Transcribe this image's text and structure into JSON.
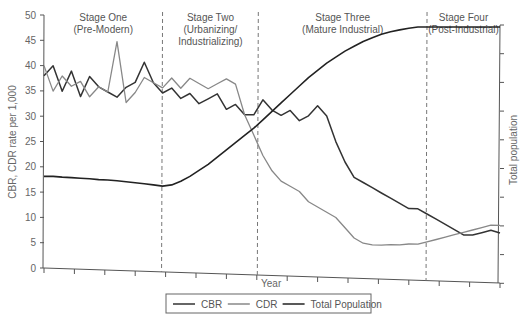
{
  "chart_data": {
    "type": "line",
    "title": "",
    "xlabel": "Year",
    "ylabel": "CBR, CDR rate per 1,000",
    "y2label": "Total population",
    "ylim": [
      0,
      50
    ],
    "yticks": [
      0,
      5,
      10,
      15,
      20,
      25,
      30,
      35,
      40,
      45,
      50
    ],
    "x_ticks_count": 16,
    "grid": false,
    "legend_position": "bottom",
    "stages": [
      {
        "name": "Stage One",
        "subtitle": [
          "(Pre-Modern)"
        ],
        "x_end": 0.26
      },
      {
        "name": "Stage Two",
        "subtitle": [
          "(Urbanizing/",
          "Industrializing)"
        ],
        "x_end": 0.47
      },
      {
        "name": "Stage Three",
        "subtitle": [
          "(Mature Industrial)"
        ],
        "x_end": 0.84
      },
      {
        "name": "Stage Four",
        "subtitle": [
          "(Post-Industrial)"
        ],
        "x_end": 1.0
      }
    ],
    "x": [
      0,
      0.02,
      0.04,
      0.06,
      0.08,
      0.1,
      0.12,
      0.14,
      0.16,
      0.18,
      0.2,
      0.22,
      0.24,
      0.26,
      0.28,
      0.3,
      0.32,
      0.34,
      0.36,
      0.38,
      0.4,
      0.42,
      0.44,
      0.46,
      0.48,
      0.5,
      0.52,
      0.54,
      0.56,
      0.58,
      0.6,
      0.62,
      0.64,
      0.66,
      0.68,
      0.7,
      0.72,
      0.74,
      0.76,
      0.78,
      0.8,
      0.82,
      0.84,
      0.86,
      0.88,
      0.9,
      0.92,
      0.94,
      0.96,
      0.98,
      1.0
    ],
    "series": [
      {
        "name": "CBR",
        "color": "#333333",
        "width": 1.5,
        "values": [
          38,
          40,
          35,
          39,
          34,
          38,
          36,
          35,
          34,
          36,
          37,
          41,
          37,
          35,
          36,
          34,
          35,
          33,
          34,
          35,
          32,
          33,
          31,
          31,
          34,
          32,
          31,
          32,
          30,
          31,
          33,
          31,
          26,
          22,
          19,
          18,
          17,
          16,
          15,
          14,
          13,
          13,
          12,
          11,
          10,
          9,
          8,
          8,
          8.5,
          9,
          8.5
        ]
      },
      {
        "name": "CDR",
        "color": "#888888",
        "width": 1.3,
        "values": [
          40,
          35,
          38,
          36,
          37,
          34,
          36,
          35,
          45,
          33,
          35,
          38,
          37,
          36,
          38,
          36,
          38,
          37,
          36,
          37,
          38,
          37,
          31,
          27,
          23,
          20,
          18,
          17,
          16,
          14,
          13,
          12,
          11,
          9,
          7,
          6,
          5.7,
          5.7,
          5.8,
          5.8,
          6,
          6,
          6.5,
          7,
          7.5,
          8,
          8.5,
          9,
          9.5,
          10,
          10
        ]
      },
      {
        "name": "Total Population",
        "color": "#222222",
        "width": 1.6,
        "relative_values": [
          0.38,
          0.38,
          0.377,
          0.375,
          0.372,
          0.37,
          0.367,
          0.365,
          0.362,
          0.358,
          0.354,
          0.35,
          0.345,
          0.34,
          0.345,
          0.36,
          0.38,
          0.405,
          0.43,
          0.46,
          0.49,
          0.52,
          0.55,
          0.58,
          0.615,
          0.65,
          0.685,
          0.72,
          0.755,
          0.79,
          0.82,
          0.85,
          0.875,
          0.9,
          0.92,
          0.94,
          0.955,
          0.97,
          0.98,
          0.988,
          0.995,
          1.0,
          1.0,
          1.0,
          1.0,
          1.0,
          1.0,
          1.0,
          1.0,
          1.0,
          1.0
        ]
      }
    ]
  },
  "legend": {
    "items": [
      {
        "label": "CBR",
        "color": "#333333"
      },
      {
        "label": "CDR",
        "color": "#888888"
      },
      {
        "label": "Total Population",
        "color": "#222222"
      }
    ]
  },
  "axes": {
    "ylabel": "CBR, CDR rate per 1,000",
    "y2label": "Total population",
    "xlabel": "Year"
  }
}
